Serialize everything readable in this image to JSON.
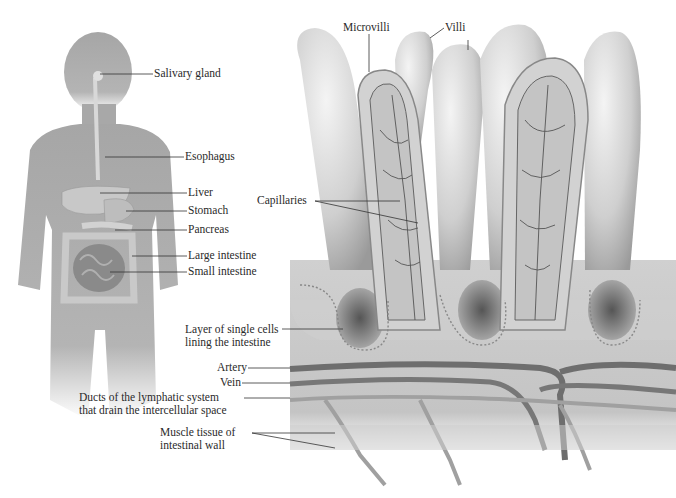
{
  "figure": {
    "type": "anatomical-diagram"
  },
  "body_panel": {
    "labels": [
      {
        "id": "salivary",
        "text": "Salivary gland"
      },
      {
        "id": "esophagus",
        "text": "Esophagus"
      },
      {
        "id": "liver",
        "text": "Liver"
      },
      {
        "id": "stomach",
        "text": "Stomach"
      },
      {
        "id": "pancreas",
        "text": "Pancreas"
      },
      {
        "id": "large_intestine",
        "text": "Large intestine"
      },
      {
        "id": "small_intestine",
        "text": "Small intestine"
      }
    ]
  },
  "villi_panel": {
    "labels": [
      {
        "id": "microvilli",
        "text": "Microvilli"
      },
      {
        "id": "villi",
        "text": "Villi"
      },
      {
        "id": "capillaries",
        "text": "Capillaries"
      },
      {
        "id": "cell_layer",
        "lines": [
          "Layer of single cells",
          "lining the intestine"
        ]
      },
      {
        "id": "artery",
        "text": "Artery"
      },
      {
        "id": "vein",
        "text": "Vein"
      },
      {
        "id": "lymph",
        "lines": [
          "Ducts of the lymphatic system",
          "that drain the intercellular space"
        ]
      },
      {
        "id": "muscle",
        "lines": [
          "Muscle tissue of",
          "intestinal wall"
        ]
      }
    ]
  },
  "colors": {
    "silhouette": "#a9a9a9",
    "villus_fill": "#d6d6d6",
    "vessel": "#6e6e6e",
    "leader_line": "#333333"
  }
}
